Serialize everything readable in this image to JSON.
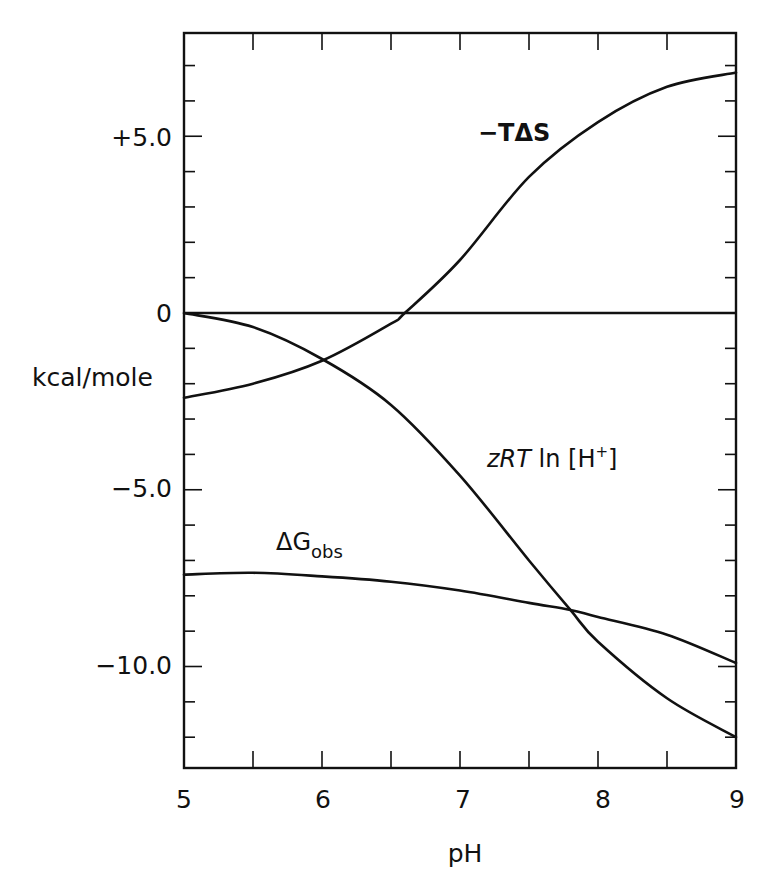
{
  "chart_data": {
    "type": "line",
    "title": "",
    "xlabel": "pH",
    "ylabel": "kcal/mole",
    "xlim": [
      5,
      9
    ],
    "ylim": [
      -12.9,
      7.9
    ],
    "grid": false,
    "legend": "none (curves labeled inline)",
    "x_ticks": [
      5,
      6,
      7,
      8,
      9
    ],
    "x_tick_labels": [
      "5",
      "6",
      "7",
      "8",
      "9"
    ],
    "x_minor_ticks": [
      5.5,
      6.5,
      7.5,
      8.5
    ],
    "y_ticks": [
      5.0,
      0,
      -5.0,
      -10.0
    ],
    "y_tick_labels": [
      "+5.0",
      "0",
      "−5.0",
      "−10.0"
    ],
    "y_minor_step": 1,
    "reference_line": {
      "y": 0
    },
    "series": [
      {
        "name": "−TΔS",
        "label_text": "−TΔS",
        "x": [
          5.0,
          5.5,
          6.0,
          6.5,
          6.6,
          7.0,
          7.5,
          8.0,
          8.5,
          9.0
        ],
        "values": [
          -2.4,
          -2.0,
          -1.35,
          -0.3,
          0.0,
          1.5,
          3.85,
          5.4,
          6.4,
          6.8
        ]
      },
      {
        "name": "zRT ln[H+]",
        "label_text": "zRT ln [H+]",
        "x": [
          5.0,
          5.5,
          6.0,
          6.5,
          7.0,
          7.5,
          7.8,
          8.0,
          8.5,
          9.0
        ],
        "values": [
          0.0,
          -0.4,
          -1.3,
          -2.6,
          -4.6,
          -7.0,
          -8.4,
          -9.3,
          -10.9,
          -12.0
        ]
      },
      {
        "name": "ΔG_obs",
        "label_text": "ΔG",
        "label_sub": "obs",
        "x": [
          5.0,
          5.5,
          6.0,
          6.5,
          7.0,
          7.5,
          7.8,
          8.0,
          8.5,
          9.0
        ],
        "values": [
          -7.4,
          -7.35,
          -7.45,
          -7.6,
          -7.85,
          -8.2,
          -8.4,
          -8.6,
          -9.1,
          -9.9
        ]
      }
    ]
  },
  "labels": {
    "x_axis_title": "pH",
    "y_axis_title": "kcal/mole",
    "curve_tds_text": "−TΔS",
    "curve_zrt_z": "z",
    "curve_zrt_rt": "RT",
    "curve_zrt_ln": " ln ",
    "curve_zrt_h": "[H",
    "curve_zrt_plus": "+",
    "curve_zrt_close": "]",
    "curve_dg_main": "ΔG",
    "curve_dg_sub": "obs",
    "ytick_0": "+5.0",
    "ytick_1": "0",
    "ytick_2": "−5.0",
    "ytick_3": "−10.0",
    "xtick_0": "5",
    "xtick_1": "6",
    "xtick_2": "7",
    "xtick_3": "8",
    "xtick_4": "9"
  }
}
